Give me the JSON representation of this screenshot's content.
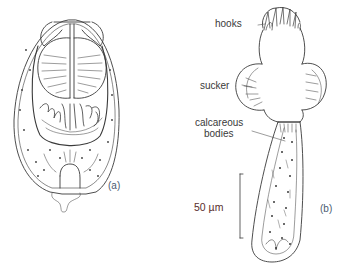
{
  "figure": {
    "panel_a": {
      "tag": "(a)"
    },
    "panel_b": {
      "tag": "(b)",
      "labels": {
        "hooks": "hooks",
        "sucker": "sucker",
        "calcareous_line1": "calcareous",
        "calcareous_line2": "bodies"
      },
      "scale_bar": "50 µm"
    }
  },
  "colors": {
    "line": "#3a3a3a",
    "background": "#ffffff",
    "scale_text": "#5a2d2d",
    "tag_text": "#4a5a70"
  }
}
